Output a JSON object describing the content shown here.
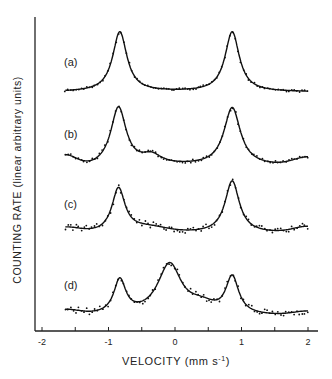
{
  "chart_data": {
    "type": "line",
    "title": "",
    "xlabel": "VELOCITY (mm s⁻¹)",
    "ylabel": "COUNTING RATE (linear arbitrary units)",
    "xlim": [
      -2,
      2
    ],
    "x_ticks": [
      -2,
      -1,
      0,
      1,
      2
    ],
    "x_tick_labels": [
      "-2",
      "-1",
      "0",
      "1",
      "2"
    ],
    "grid": false,
    "legend": null,
    "series": [
      {
        "name": "(a)",
        "label": "(a)",
        "x_range": [
          -1.65,
          2.0
        ],
        "baseline_px": 92,
        "peaks": [
          {
            "v": -0.83,
            "height_px": 60,
            "width": 0.13
          },
          {
            "v": 0.86,
            "height_px": 60,
            "width": 0.13
          }
        ],
        "points": [
          [
            -1.65,
            0.02
          ],
          [
            -1.4,
            0.03
          ],
          [
            -1.1,
            0.09
          ],
          [
            -0.95,
            0.4
          ],
          [
            -0.83,
            1.0
          ],
          [
            -0.7,
            0.4
          ],
          [
            -0.5,
            0.08
          ],
          [
            0,
            0.02
          ],
          [
            0.5,
            0.1
          ],
          [
            0.74,
            0.42
          ],
          [
            0.86,
            1.0
          ],
          [
            1.0,
            0.4
          ],
          [
            1.3,
            0.07
          ],
          [
            2.0,
            0.0
          ]
        ]
      },
      {
        "name": "(b)",
        "label": "(b)",
        "x_range": [
          -1.65,
          2.0
        ],
        "baseline_px": 166,
        "peaks": [
          {
            "v": -0.85,
            "height_px": 58,
            "width": 0.14
          },
          {
            "v": -0.35,
            "height_px": 9,
            "width": 0.18
          },
          {
            "v": 0.86,
            "height_px": 58,
            "width": 0.15
          }
        ],
        "points": [
          [
            -1.65,
            0.2
          ],
          [
            -1.4,
            0.0
          ],
          [
            -1.1,
            0.1
          ],
          [
            -0.85,
            1.0
          ],
          [
            -0.6,
            0.2
          ],
          [
            -0.35,
            0.25
          ],
          [
            0.2,
            0.0
          ],
          [
            0.6,
            0.25
          ],
          [
            0.86,
            1.0
          ],
          [
            1.2,
            0.1
          ],
          [
            1.6,
            0.0
          ],
          [
            2.0,
            0.2
          ]
        ]
      },
      {
        "name": "(c)",
        "label": "(c)",
        "x_range": [
          -1.65,
          2.0
        ],
        "baseline_px": 233,
        "peaks": [
          {
            "v": -0.85,
            "height_px": 44,
            "width": 0.12
          },
          {
            "v": 0.86,
            "height_px": 52,
            "width": 0.13
          }
        ],
        "points": [
          [
            -1.65,
            0.1
          ],
          [
            -1.3,
            0.0
          ],
          [
            -1.0,
            0.3
          ],
          [
            -0.85,
            1.0
          ],
          [
            -0.6,
            0.15
          ],
          [
            0.0,
            0.05
          ],
          [
            0.6,
            0.25
          ],
          [
            0.86,
            1.0
          ],
          [
            1.2,
            0.1
          ],
          [
            1.6,
            0.0
          ],
          [
            2.0,
            0.1
          ]
        ]
      },
      {
        "name": "(d)",
        "label": "(d)",
        "x_range": [
          -1.65,
          2.0
        ],
        "baseline_px": 316,
        "peaks": [
          {
            "v": -0.83,
            "height_px": 34,
            "width": 0.11
          },
          {
            "v": -0.08,
            "height_px": 52,
            "width": 0.22
          },
          {
            "v": 0.86,
            "height_px": 38,
            "width": 0.12
          }
        ],
        "points": [
          [
            -1.65,
            0.1
          ],
          [
            -1.3,
            0.0
          ],
          [
            -1.0,
            0.3
          ],
          [
            -0.83,
            0.7
          ],
          [
            -0.6,
            0.3
          ],
          [
            -0.08,
            1.0
          ],
          [
            0.3,
            0.3
          ],
          [
            0.55,
            0.25
          ],
          [
            0.86,
            0.75
          ],
          [
            1.2,
            0.05
          ],
          [
            1.6,
            0.0
          ],
          [
            2.0,
            0.1
          ]
        ]
      }
    ],
    "annotations": [
      "(a)",
      "(b)",
      "(c)",
      "(d)"
    ]
  },
  "axes": {
    "xlabel": "VELOCITY (mm s",
    "xlabel_sup": "-1",
    "xlabel_close": ")",
    "ylabel": "COUNTING RATE (linear arbitrary units)",
    "ticks": [
      "-2",
      "-1",
      "0",
      "1",
      "2"
    ]
  },
  "labels": {
    "a": "(a)",
    "b": "(b)",
    "c": "(c)",
    "d": "(d)"
  }
}
